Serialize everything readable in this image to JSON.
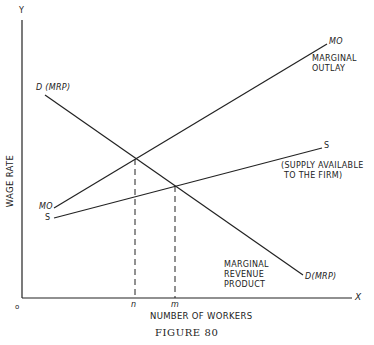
{
  "figure": {
    "caption": "FIGURE 80",
    "y_axis_label": "WAGE RATE",
    "x_axis_label": "NUMBER OF WORKERS",
    "y_axis_letter": "Y",
    "x_axis_letter": "X",
    "origin": "o",
    "tick_n": "n",
    "tick_m": "m"
  },
  "curves": {
    "mo": {
      "start_label": "MO",
      "end_label": "MO",
      "desc_line1": "MARGINAL",
      "desc_line2": "OUTLAY"
    },
    "s": {
      "start_label": "S",
      "end_label": "S",
      "desc_line1": "(SUPPLY AVAILABLE",
      "desc_line2": "TO THE FIRM)"
    },
    "d": {
      "start_label": "D (MRP)",
      "end_label": "D(MRP)",
      "desc_line1": "MARGINAL",
      "desc_line2": "REVENUE",
      "desc_line3": "PRODUCT"
    }
  },
  "colors": {
    "line": "#222222",
    "background": "#ffffff"
  }
}
